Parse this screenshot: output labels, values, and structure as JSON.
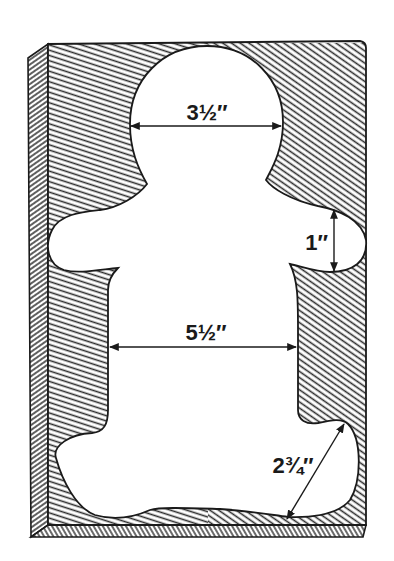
{
  "figure": {
    "colors": {
      "ink": "#1a1a1a",
      "paper": "#ffffff",
      "hatch": "#2b2b2b"
    }
  },
  "dimensions": [
    {
      "id": "head-width",
      "label": "3½″",
      "orientation": "horizontal"
    },
    {
      "id": "arm-height",
      "label": "1″",
      "orientation": "vertical"
    },
    {
      "id": "body-width",
      "label": "5½″",
      "orientation": "horizontal"
    },
    {
      "id": "foot-length",
      "label": "2¾″",
      "orientation": "diagonal"
    }
  ]
}
